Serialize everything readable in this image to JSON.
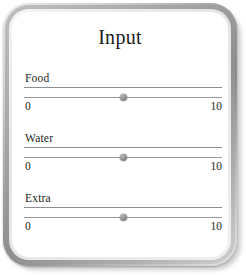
{
  "panel": {
    "title": "Input",
    "frame_color": "#9a9a9a",
    "background_color": "#ffffff",
    "text_color": "#1e1e1e",
    "track_color": "#9a9a9a",
    "handle_color": "#8d8d8d"
  },
  "sliders": [
    {
      "label": "Food",
      "min_label": "0",
      "max_label": "10",
      "min": 0,
      "max": 10,
      "value": 5,
      "handle_percent": 50
    },
    {
      "label": "Water",
      "min_label": "0",
      "max_label": "10",
      "min": 0,
      "max": 10,
      "value": 5,
      "handle_percent": 50
    },
    {
      "label": "Extra",
      "min_label": "0",
      "max_label": "10",
      "min": 0,
      "max": 10,
      "value": 5,
      "handle_percent": 50
    }
  ]
}
